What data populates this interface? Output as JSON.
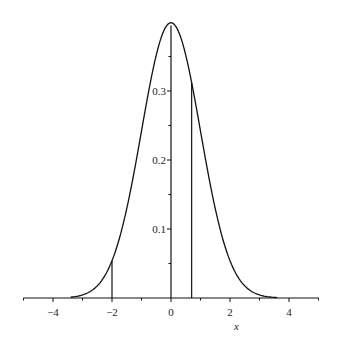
{
  "chart_data": {
    "type": "line",
    "title": "",
    "xlabel": "x",
    "ylabel": "",
    "xlim": [
      -5,
      5
    ],
    "ylim": [
      0,
      0.4
    ],
    "grid": false,
    "legend": null,
    "x_ticks": [
      -4,
      -2,
      0,
      2,
      4
    ],
    "x_tick_labels": [
      "−4",
      "−2",
      "0",
      "2",
      "4"
    ],
    "x_minor_ticks": [
      -5,
      -3,
      -1,
      1,
      3,
      5
    ],
    "y_ticks": [
      0.1,
      0.2,
      0.3
    ],
    "y_tick_labels": [
      "0.1",
      "0.2",
      "0.3"
    ],
    "y_minor_ticks": [
      0.05,
      0.15,
      0.25,
      0.35
    ],
    "series": [
      {
        "name": "standard normal density",
        "function": "exp(-x^2/2)/sqrt(2*pi)",
        "x": [
          -5,
          -4,
          -3.5,
          -3,
          -2.5,
          -2,
          -1.5,
          -1,
          -0.5,
          0,
          0.5,
          1,
          1.5,
          2,
          2.5,
          3,
          3.5,
          4,
          5
        ],
        "y": [
          1.5e-06,
          0.0001,
          0.0009,
          0.0044,
          0.0175,
          0.054,
          0.1295,
          0.242,
          0.3521,
          0.3989,
          0.3521,
          0.242,
          0.1295,
          0.054,
          0.0175,
          0.0044,
          0.0009,
          0.0001,
          1.5e-06
        ]
      }
    ],
    "annotations": [
      {
        "type": "vertical-line",
        "x": -2,
        "from": 0,
        "to": 0.054
      },
      {
        "type": "vertical-line",
        "x": 0.7,
        "from": 0,
        "to": 0.3123
      }
    ]
  },
  "plot": {
    "origin_px": [
      171,
      298
    ],
    "px_per_x_unit": 29.5,
    "px_per_y_unit": 690,
    "line_color": "#111111"
  }
}
